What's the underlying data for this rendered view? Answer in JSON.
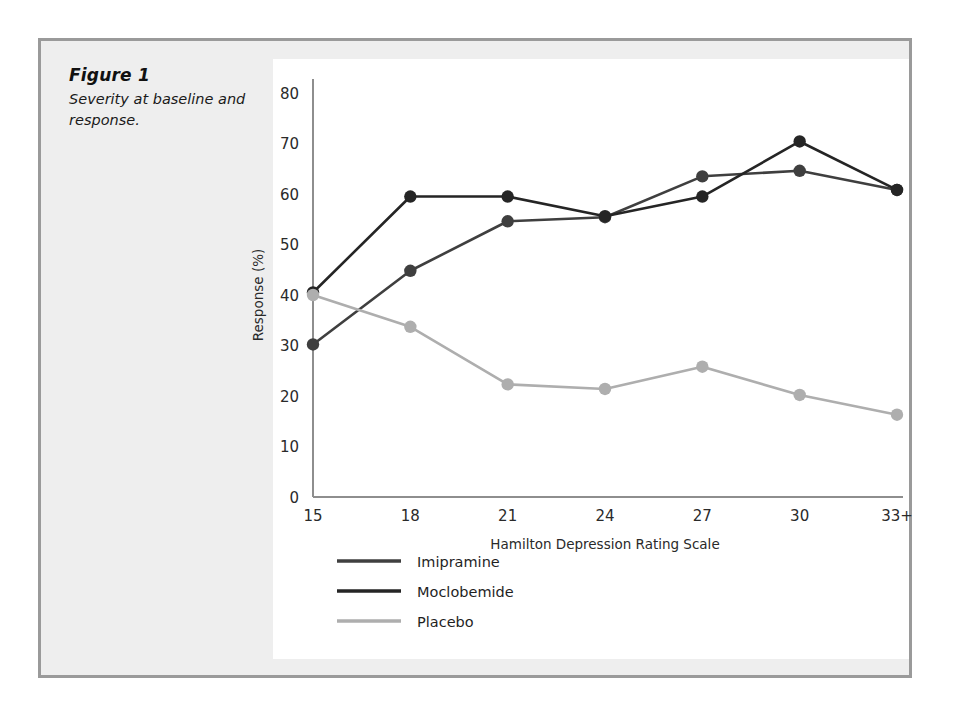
{
  "figure": {
    "caption_title": "Figure 1",
    "caption_text": "Severity at baseline and response.",
    "panel_bg": "#eeeeee",
    "panel_border": "#9a9a9a",
    "plot_bg": "#ffffff"
  },
  "chart_data": {
    "type": "line",
    "title": "",
    "subtitle": "",
    "xlabel": "Hamilton Depression Rating Scale",
    "ylabel": "Response (%)",
    "categories": [
      "15",
      "18",
      "21",
      "24",
      "27",
      "30",
      "33+"
    ],
    "x": [
      15,
      18,
      21,
      24,
      27,
      30,
      33
    ],
    "xtick_labels": [
      "15",
      "18",
      "21",
      "24",
      "27",
      "30",
      "33+"
    ],
    "ytick_labels": [
      "0",
      "10",
      "20",
      "30",
      "40",
      "50",
      "60",
      "70",
      "80"
    ],
    "yticks": [
      0,
      10,
      20,
      30,
      40,
      50,
      60,
      70,
      80
    ],
    "ylim": [
      0,
      80
    ],
    "grid": false,
    "legend_position": "bottom-left",
    "markers": "filled-circle",
    "series": [
      {
        "name": "Imipramine",
        "color": "#3f3f3f",
        "values": [
          30.2,
          44.8,
          54.6,
          55.4,
          63.5,
          64.6,
          60.8
        ]
      },
      {
        "name": "Moclobemide",
        "color": "#252525",
        "values": [
          40.5,
          59.5,
          59.5,
          55.6,
          59.5,
          70.4,
          60.8
        ]
      },
      {
        "name": "Placebo",
        "color": "#aeaeae",
        "values": [
          40.0,
          33.7,
          22.3,
          21.4,
          25.8,
          20.2,
          16.3
        ]
      }
    ]
  },
  "legend": {
    "items": [
      {
        "label": "Imipramine",
        "color": "#3f3f3f"
      },
      {
        "label": "Moclobemide",
        "color": "#252525"
      },
      {
        "label": "Placebo",
        "color": "#aeaeae"
      }
    ]
  },
  "axes": {
    "y_axis_title": "Response (%)",
    "x_axis_title": "Hamilton Depression Rating Scale"
  }
}
